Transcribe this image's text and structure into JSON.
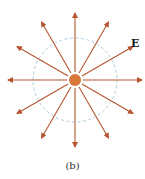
{
  "diagram": {
    "field_label": "E",
    "caption": "(b)",
    "center": [
      75,
      80
    ],
    "charge_radius": 6,
    "dashed_circle_radius": 42,
    "arrow_length": 67,
    "arrow_count": 12,
    "colors": {
      "arrow": "#b5562f",
      "charge": "#d9763a",
      "dashed_circle": "#9fc3d6"
    }
  }
}
